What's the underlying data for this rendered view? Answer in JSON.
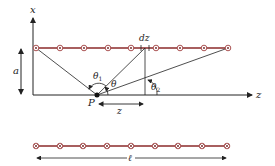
{
  "diagram": {
    "labels": {
      "x_axis": "x",
      "z_axis": "z",
      "distance_a": "a",
      "element_dz": "dz",
      "point_P": "P",
      "distance_z": "z",
      "theta_1": "θ",
      "theta_1_sub": "1",
      "theta": "θ",
      "theta_2": "θ",
      "theta_2_sub": "2",
      "length_l": "ℓ"
    },
    "top_wire": {
      "current_symbol": "dot (out of page)",
      "circle_count": 9
    },
    "bottom_wire": {
      "current_symbol": "cross (into page)",
      "circle_count": 9
    },
    "colors": {
      "wire": "#8b2a2a",
      "circle_stroke": "#a04040",
      "lines": "#222222",
      "background": "#ffffff"
    }
  }
}
